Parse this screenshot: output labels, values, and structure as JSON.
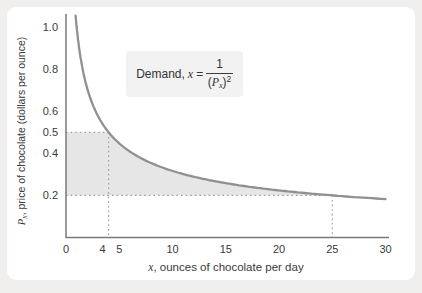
{
  "annotation": {
    "prefix": "Demand,",
    "var": "x",
    "equals": "=",
    "numerator": "1",
    "den_open": "(",
    "den_var": "P",
    "den_sub": "x",
    "den_close": ")",
    "exponent": "2"
  },
  "axes": {
    "y_title": {
      "var": "P",
      "sub": "x",
      "rest": ", price of chocolate (dollars per ounce)"
    },
    "x_title": {
      "var": "x",
      "rest": ", ounces of chocolate per day"
    }
  },
  "chart_data": {
    "type": "line",
    "title": "",
    "annotation_text": "Demand, x = 1/(Px)2",
    "curve": {
      "expr": "P = 1/sqrt(x)  (i.e. x = 1/P^2)",
      "x_start": 0.9,
      "x_end": 30
    },
    "xlabel": "x, ounces of chocolate per day",
    "ylabel": "Px, price of chocolate (dollars per ounce)",
    "xlim": [
      0,
      30
    ],
    "ylim": [
      0,
      1.0
    ],
    "grid": false,
    "legend": null,
    "x_ticks": [
      {
        "v": 0,
        "label": "0",
        "dx": 0
      },
      {
        "v": 4,
        "label": "4",
        "dx": -6
      },
      {
        "v": 5,
        "label": "5",
        "dx": 0
      },
      {
        "v": 10,
        "label": "10",
        "dx": 0
      },
      {
        "v": 15,
        "label": "15",
        "dx": 0
      },
      {
        "v": 20,
        "label": "20",
        "dx": 0
      },
      {
        "v": 25,
        "label": "25",
        "dx": 0
      },
      {
        "v": 30,
        "label": "30",
        "dx": 0
      }
    ],
    "y_ticks": [
      {
        "v": 1.0,
        "label": "1.0"
      },
      {
        "v": 0.8,
        "label": "0.8"
      },
      {
        "v": 0.6,
        "label": "0.6"
      },
      {
        "v": 0.5,
        "label": "0.5"
      },
      {
        "v": 0.4,
        "label": "0.4"
      },
      {
        "v": 0.2,
        "label": "0.2"
      }
    ],
    "sample_points": [
      {
        "x": 1,
        "p": 1.0
      },
      {
        "x": 4,
        "p": 0.5
      },
      {
        "x": 9,
        "p": 0.333
      },
      {
        "x": 16,
        "p": 0.25
      },
      {
        "x": 25,
        "p": 0.2
      },
      {
        "x": 30,
        "p": 0.183
      }
    ],
    "reference_points": [
      {
        "x": 4,
        "p": 0.5
      },
      {
        "x": 25,
        "p": 0.2
      }
    ],
    "shaded_region": {
      "p_low": 0.2,
      "p_high": 0.5,
      "x_at_p_high": 4,
      "x_at_p_low": 25
    },
    "colors": {
      "curve": "#909090",
      "axis": "#7a7a7a",
      "dotted": "#a2a2a2",
      "shade": "#e6e6e6",
      "text": "#3a3a3a",
      "formula_box": "#f2f2f2",
      "panel": "#ffffff",
      "page_bg": "#f1efed"
    }
  }
}
